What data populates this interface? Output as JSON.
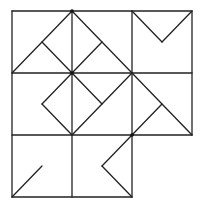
{
  "diagram": {
    "type": "line-figure",
    "stroke_color": "#222222",
    "background_color": "#ffffff",
    "grid": {
      "x": [
        12,
        72,
        132,
        192
      ],
      "y": [
        11,
        73,
        135,
        197
      ],
      "rows": 3,
      "cols": 3,
      "missing_cells": [
        [
          2,
          2
        ]
      ]
    },
    "outline_segments": [
      [
        12,
        11,
        192,
        11
      ],
      [
        12,
        73,
        192,
        73
      ],
      [
        12,
        135,
        192,
        135
      ],
      [
        12,
        197,
        132,
        197
      ],
      [
        12,
        11,
        12,
        197
      ],
      [
        72,
        11,
        72,
        197
      ],
      [
        132,
        11,
        132,
        197
      ],
      [
        192,
        11,
        192,
        135
      ]
    ],
    "cells": [
      {
        "name": "cell-top-left",
        "segments": [
          [
            12,
            73,
            72,
            11
          ],
          [
            42,
            42,
            72,
            73
          ]
        ]
      },
      {
        "name": "cell-top-center",
        "segments": [
          [
            72,
            11,
            132,
            73
          ],
          [
            72,
            73,
            102,
            42
          ]
        ]
      },
      {
        "name": "cell-top-right",
        "segments": [
          [
            132,
            11,
            162,
            42
          ],
          [
            162,
            42,
            192,
            11
          ]
        ]
      },
      {
        "name": "cell-middle-left",
        "segments": [
          [
            72,
            73,
            42,
            104
          ],
          [
            42,
            104,
            72,
            135
          ]
        ]
      },
      {
        "name": "cell-middle-center",
        "segments": [
          [
            72,
            73,
            102,
            104
          ],
          [
            132,
            73,
            72,
            135
          ]
        ]
      },
      {
        "name": "cell-middle-right",
        "segments": [
          [
            132,
            73,
            192,
            135
          ],
          [
            132,
            135,
            162,
            104
          ]
        ]
      },
      {
        "name": "cell-bottom-left",
        "segments": [
          [
            12,
            197,
            42,
            166
          ]
        ]
      },
      {
        "name": "cell-bottom-center",
        "segments": [
          [
            132,
            135,
            102,
            166
          ],
          [
            102,
            166,
            132,
            197
          ]
        ]
      }
    ],
    "dots": [
      [
        72,
        11
      ],
      [
        72,
        73
      ],
      [
        132,
        135
      ]
    ]
  }
}
